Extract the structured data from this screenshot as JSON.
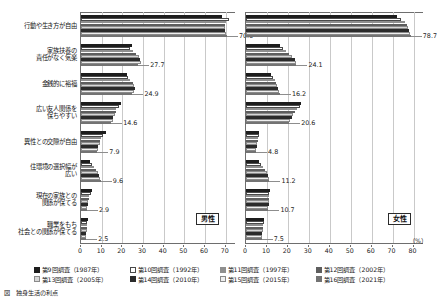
{
  "chart_data": {
    "type": "bar",
    "title": "",
    "orientation": "horizontal",
    "grid": true,
    "legend_position": "bottom",
    "xlabel": "(%)",
    "ylabel": "",
    "panels": [
      {
        "name": "male",
        "tag": "男性",
        "xlim": [
          0,
          75
        ],
        "xticks": [
          0,
          10,
          20,
          30,
          40,
          50,
          60,
          70
        ],
        "series": [
          {
            "name": "第9回調査（1987年）",
            "values": [
              68.0,
              24.8,
              22.2,
              19.3,
              11.9,
              4.2,
              5.2,
              3.6
            ]
          },
          {
            "name": "第10回調査（1992年）",
            "values": [
              71.6,
              23.5,
              22.9,
              18.6,
              10.6,
              5.1,
              4.6,
              3.1
            ]
          },
          {
            "name": "第11回調査（1997年）",
            "values": [
              70.2,
              25.3,
              23.6,
              17.0,
              9.8,
              6.3,
              4.0,
              3.0
            ]
          },
          {
            "name": "第12回調査（2002年）",
            "values": [
              69.7,
              26.4,
              25.1,
              16.8,
              9.4,
              7.2,
              3.8,
              2.8
            ]
          },
          {
            "name": "第13回調査（2005年）",
            "values": [
              69.7,
              28.0,
              25.7,
              16.3,
              9.1,
              8.1,
              3.4,
              2.7
            ]
          },
          {
            "name": "第14回調査（2010年）",
            "values": [
              69.7,
              28.7,
              26.0,
              15.6,
              8.4,
              8.6,
              3.2,
              2.6
            ]
          },
          {
            "name": "第15回調査（2015年）",
            "values": [
              70.1,
              28.8,
              25.8,
              15.4,
              8.2,
              9.1,
              3.0,
              2.5
            ]
          },
          {
            "name": "第16回調査（2021年）",
            "values": [
              70.6,
              27.7,
              24.9,
              14.6,
              7.9,
              9.6,
              2.9,
              2.5
            ]
          }
        ],
        "last_labels": [
          "70.6",
          "27.7",
          "24.9",
          "14.6",
          "7.9",
          "9.6",
          "2.9",
          "2.5"
        ]
      },
      {
        "name": "female",
        "tag": "女性",
        "xlim": [
          0,
          85
        ],
        "xticks": [
          0,
          10,
          20,
          30,
          40,
          50,
          60,
          70,
          80
        ],
        "series": [
          {
            "name": "第9回調査（1987年）",
            "values": [
              71.9,
              16.4,
              12.1,
              26.4,
              6.3,
              6.0,
              11.3,
              8.6
            ]
          },
          {
            "name": "第10回調査（1992年）",
            "values": [
              74.2,
              17.8,
              13.1,
              25.6,
              6.2,
              7.0,
              11.1,
              8.4
            ]
          },
          {
            "name": "第11回調査（1997年）",
            "values": [
              75.9,
              19.1,
              13.8,
              24.4,
              5.9,
              8.2,
              11.0,
              8.2
            ]
          },
          {
            "name": "第12回調査（2002年）",
            "values": [
              76.8,
              20.6,
              14.3,
              23.5,
              5.6,
              9.0,
              10.9,
              8.0
            ]
          },
          {
            "name": "第13回調査（2005年）",
            "values": [
              77.5,
              22.0,
              14.9,
              22.5,
              5.3,
              9.8,
              10.8,
              7.9
            ]
          },
          {
            "name": "第14回調査（2010年）",
            "values": [
              78.0,
              23.2,
              15.4,
              21.8,
              5.1,
              10.4,
              10.8,
              7.7
            ]
          },
          {
            "name": "第15回調査（2015年）",
            "values": [
              78.3,
              23.8,
              15.9,
              21.2,
              4.9,
              10.9,
              10.7,
              7.6
            ]
          },
          {
            "name": "第16回調査（2021年）",
            "values": [
              78.7,
              24.1,
              16.2,
              20.6,
              4.8,
              11.2,
              10.7,
              7.5
            ]
          }
        ],
        "last_labels": [
          "78.7",
          "24.1",
          "16.2",
          "20.6",
          "4.8",
          "11.2",
          "10.7",
          "7.5"
        ]
      }
    ],
    "categories": [
      {
        "lines": [
          "行動や生き方が自由"
        ]
      },
      {
        "lines": [
          "家族扶養の",
          "責任がなく気楽"
        ]
      },
      {
        "lines": [
          "金銭的に裕福"
        ]
      },
      {
        "lines": [
          "広い友人関係を",
          "保ちやすい"
        ]
      },
      {
        "lines": [
          "異性との交際が自由"
        ]
      },
      {
        "lines": [
          "住環境の選択幅が",
          "広い"
        ]
      },
      {
        "lines": [
          "現在の家族との",
          "関係が保てる"
        ]
      },
      {
        "lines": [
          "職業をもち",
          "社会との関係が保てる"
        ]
      }
    ],
    "legend": [
      {
        "label": "第9回調査（1987年）",
        "swatch": "solid-black"
      },
      {
        "label": "第10回調査（1992年）",
        "swatch": "white-outline"
      },
      {
        "label": "第11回調査（1997年）",
        "swatch": "mid-grey"
      },
      {
        "label": "第12回調査（2002年）",
        "swatch": "dark-grey"
      },
      {
        "label": "第13回調査（2005年）",
        "swatch": "light-hatch"
      },
      {
        "label": "第14回調査（2010年）",
        "swatch": "near-black"
      },
      {
        "label": "第15回調査（2015年）",
        "swatch": "pale-hatch"
      },
      {
        "label": "第16回調査（2021年）",
        "swatch": "grey"
      }
    ],
    "axis_unit": "（%）"
  },
  "caption": "図　独身生活の利点"
}
